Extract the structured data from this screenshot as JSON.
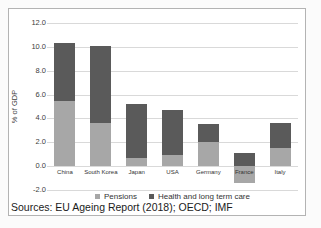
{
  "figure": {
    "background": "#ffffff",
    "border_color": "#b3b3b3",
    "gridline_color": "#d9d9d9"
  },
  "chart_data": {
    "type": "bar",
    "stacked": true,
    "title": "",
    "xlabel": "",
    "ylabel": "% of GDP",
    "ylim": [
      -2.0,
      12.0
    ],
    "ytick_step": 2.0,
    "yticks": [
      "12.0",
      "10.0",
      "8.0",
      "6.0",
      "4.0",
      "2.0",
      "0.0",
      "-2.0"
    ],
    "grid": true,
    "legend_position": "bottom",
    "categories": [
      "China",
      "South Korea",
      "Japan",
      "USA",
      "Germany",
      "France",
      "Italy"
    ],
    "series": [
      {
        "name": "Pensions",
        "color": "#a7a7a7",
        "values": [
          5.5,
          3.6,
          0.7,
          0.9,
          2.0,
          -1.4,
          1.5
        ]
      },
      {
        "name": "Health and long term care",
        "color": "#5a5a5a",
        "values": [
          4.8,
          6.5,
          4.5,
          3.8,
          1.5,
          1.1,
          2.1
        ]
      }
    ]
  },
  "source_note": "Sources: EU Ageing Report (2018); OECD; IMF"
}
